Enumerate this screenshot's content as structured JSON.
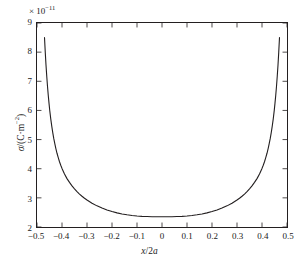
{
  "figure": {
    "exponent_prefix": "× 10",
    "exponent_value": "−11",
    "ylabel_symbol": "σ",
    "ylabel_rest": "/(C·m",
    "ylabel_sup": "−2",
    "ylabel_close": ")",
    "xlabel_italic_x": "x",
    "xlabel_slash": "/2",
    "xlabel_italic_a": "a",
    "line_color": "#231f20",
    "axis_color": "#231f20",
    "background_color": "#ffffff"
  },
  "chart_data": {
    "type": "line",
    "title": "",
    "xlabel": "x/2a",
    "ylabel": "σ/(C·m⁻²)",
    "y_scale_exponent": -11,
    "y_scale_label": "×10⁻¹¹",
    "xlim": [
      -0.5,
      0.5
    ],
    "ylim": [
      2,
      9
    ],
    "xticks": [
      -0.5,
      -0.4,
      -0.3,
      -0.2,
      -0.1,
      0,
      0.1,
      0.2,
      0.3,
      0.4,
      0.5
    ],
    "xtick_labels": [
      "−0.5",
      "−0.4",
      "−0.3",
      "−0.2",
      "−0.1",
      "0",
      "0.1",
      "0.2",
      "0.3",
      "0.4",
      "0.5"
    ],
    "yticks": [
      2,
      3,
      4,
      5,
      6,
      7,
      8,
      9
    ],
    "ytick_labels": [
      "2",
      "3",
      "4",
      "5",
      "6",
      "7",
      "8",
      "9"
    ],
    "grid": false,
    "legend": null,
    "tick_direction": "in",
    "box": true,
    "series": [
      {
        "name": "surface charge density",
        "color": "#231f20",
        "x": [
          -0.47,
          -0.467,
          -0.464,
          -0.461,
          -0.458,
          -0.455,
          -0.452,
          -0.449,
          -0.445,
          -0.441,
          -0.437,
          -0.433,
          -0.429,
          -0.425,
          -0.42,
          -0.415,
          -0.41,
          -0.405,
          -0.4,
          -0.39,
          -0.38,
          -0.37,
          -0.36,
          -0.35,
          -0.34,
          -0.33,
          -0.32,
          -0.31,
          -0.3,
          -0.28,
          -0.26,
          -0.24,
          -0.22,
          -0.2,
          -0.18,
          -0.16,
          -0.14,
          -0.12,
          -0.1,
          -0.08,
          -0.06,
          -0.04,
          -0.02,
          0.0,
          0.02,
          0.04,
          0.06,
          0.08,
          0.1,
          0.12,
          0.14,
          0.16,
          0.18,
          0.2,
          0.22,
          0.24,
          0.26,
          0.28,
          0.3,
          0.31,
          0.32,
          0.33,
          0.34,
          0.35,
          0.36,
          0.37,
          0.38,
          0.39,
          0.4,
          0.405,
          0.41,
          0.415,
          0.42,
          0.425,
          0.429,
          0.433,
          0.437,
          0.441,
          0.445,
          0.449,
          0.452,
          0.455,
          0.458,
          0.461,
          0.464,
          0.467,
          0.47
        ],
        "y": [
          8.5,
          8.0,
          7.56,
          7.17,
          6.83,
          6.52,
          6.25,
          6.0,
          5.71,
          5.46,
          5.24,
          5.04,
          4.87,
          4.71,
          4.53,
          4.38,
          4.24,
          4.12,
          4.01,
          3.82,
          3.66,
          3.53,
          3.41,
          3.31,
          3.215,
          3.13,
          3.055,
          2.985,
          2.925,
          2.815,
          2.725,
          2.65,
          2.585,
          2.53,
          2.485,
          2.448,
          2.418,
          2.395,
          2.378,
          2.366,
          2.358,
          2.353,
          2.351,
          2.35,
          2.351,
          2.353,
          2.358,
          2.366,
          2.378,
          2.395,
          2.418,
          2.448,
          2.485,
          2.53,
          2.585,
          2.65,
          2.725,
          2.815,
          2.925,
          2.985,
          3.055,
          3.13,
          3.215,
          3.31,
          3.41,
          3.53,
          3.66,
          3.82,
          4.01,
          4.12,
          4.24,
          4.38,
          4.53,
          4.71,
          4.87,
          5.04,
          5.24,
          5.46,
          5.71,
          6.0,
          6.25,
          6.52,
          6.83,
          7.17,
          7.56,
          8.0,
          8.5
        ]
      }
    ]
  }
}
